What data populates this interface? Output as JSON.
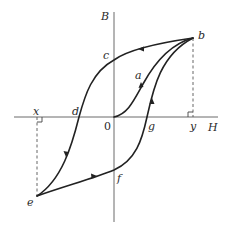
{
  "diagram": {
    "title": "",
    "axes": {
      "vertical_label": "B",
      "horizontal_label": "H",
      "origin_label": "0"
    },
    "points": {
      "a": "a",
      "b": "b",
      "c": "c",
      "d": "d",
      "e": "e",
      "f": "f",
      "g": "g",
      "x": "x",
      "y": "y"
    },
    "colors": {
      "curve": "#222222",
      "axis": "#6a6a6a",
      "background": "#ffffff"
    }
  }
}
